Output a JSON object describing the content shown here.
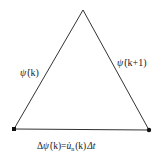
{
  "diagram": {
    "type": "triangle",
    "vertices": {
      "apex": [
        83,
        10
      ],
      "bottom_left": [
        14,
        129
      ],
      "bottom_right": [
        149,
        130
      ]
    },
    "stroke_color": "#333333",
    "labels": {
      "left_edge": "ψ̇ (k)",
      "right_edge": "ψ̇ (k+1)",
      "bottom_edge": "Δψ̇ (k) = u̇ₙ (k) Δt"
    },
    "label_parts": {
      "left": {
        "sym": "ψ̇",
        "arg": "(k)"
      },
      "right": {
        "sym": "ψ̇",
        "arg": "(k+1)"
      },
      "bottom": {
        "delta": "Δ",
        "sym": "ψ̇",
        "arg1": "(k)",
        "eq": "=",
        "u": "u̇",
        "sub": "n",
        "arg2": "(k)",
        "dt": "Δt"
      }
    }
  }
}
